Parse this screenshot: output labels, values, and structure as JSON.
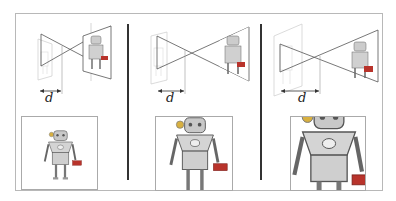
{
  "figure": {
    "panels": [
      {
        "id": 1,
        "distance_label": "d",
        "distance_px": 22,
        "zoom": 1.0
      },
      {
        "id": 2,
        "distance_label": "d",
        "distance_px": 28,
        "zoom": 1.55
      },
      {
        "id": 3,
        "distance_label": "d",
        "distance_px": 38,
        "zoom": 2.2
      }
    ]
  },
  "colors": {
    "line": "#555555",
    "divider": "#333333",
    "robot_body": "#c8c8c8",
    "robot_outline": "#555555",
    "accent_red": "#b8332b",
    "accent_yellow": "#d8b040"
  }
}
